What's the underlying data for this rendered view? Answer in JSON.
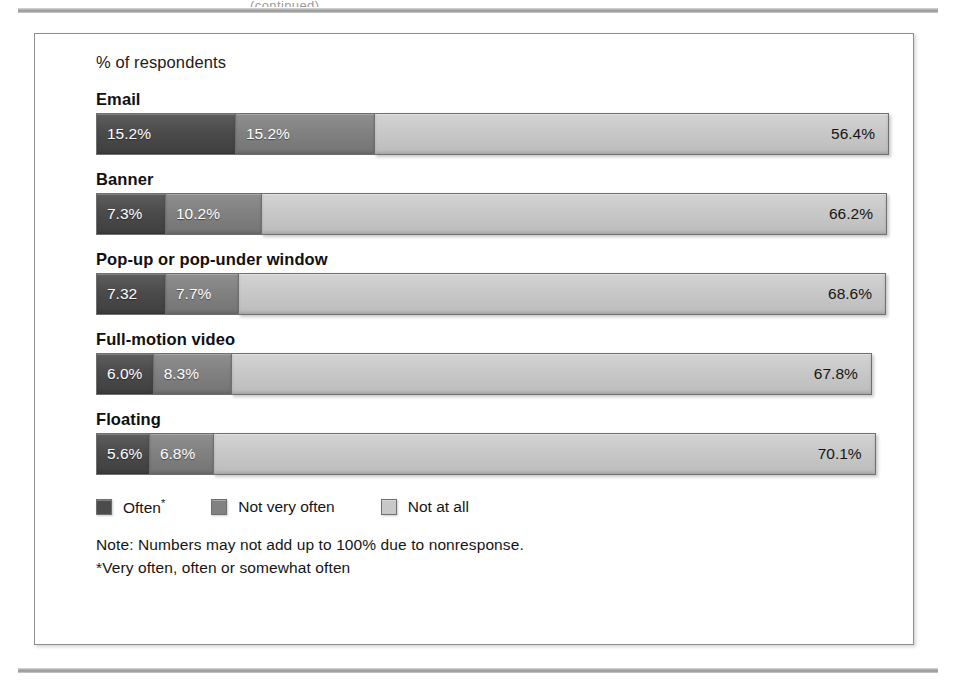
{
  "page": {
    "top_clipped_text": "(continued)",
    "rule_color": "#9a9a9a"
  },
  "figure": {
    "axis_title": "% of respondents",
    "legend": [
      {
        "label": "Often",
        "superscript": "*",
        "swatch": "#4b4b4b",
        "name": "often"
      },
      {
        "label": "Not very often",
        "superscript": "",
        "swatch": "#818181",
        "name": "not-very-often"
      },
      {
        "label": "Not at all",
        "superscript": "",
        "swatch": "#c8c8c8",
        "name": "not-at-all"
      }
    ],
    "notes": [
      "Note: Numbers may not add up to 100% due to nonresponse.",
      "*Very often, often or somewhat often"
    ]
  },
  "chart_data": {
    "type": "bar",
    "orientation": "horizontal",
    "stacked": true,
    "title": "",
    "xlabel": "% of respondents",
    "ylabel": "",
    "xlim": [
      0,
      100
    ],
    "grid": false,
    "legend_position": "bottom-left",
    "categories": [
      "Email",
      "Banner",
      "Pop-up or pop-under window",
      "Full-motion video",
      "Floating"
    ],
    "series": [
      {
        "name": "Often*",
        "color": "#4b4b4b",
        "values": [
          15.2,
          7.3,
          7.3,
          6.0,
          5.6
        ],
        "labels": [
          "15.2%",
          "7.3%",
          "7.32",
          "6.0%",
          "5.6%"
        ]
      },
      {
        "name": "Not very often",
        "color": "#818181",
        "values": [
          15.2,
          10.2,
          7.7,
          8.3,
          6.8
        ],
        "labels": [
          "15.2%",
          "10.2%",
          "7.7%",
          "8.3%",
          "6.8%"
        ]
      },
      {
        "name": "Not at all",
        "color": "#c8c8c8",
        "values": [
          56.4,
          66.2,
          68.6,
          67.8,
          70.1
        ],
        "labels": [
          "56.4%",
          "66.2%",
          "68.6%",
          "67.8%",
          "70.1%"
        ]
      }
    ],
    "notes": [
      "Note: Numbers may not add up to 100% due to nonresponse.",
      "*Very often, often or somewhat often"
    ]
  }
}
